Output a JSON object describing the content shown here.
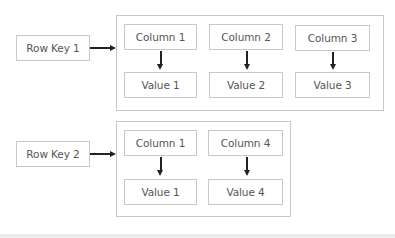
{
  "diagram": {
    "type": "wide-column-store-row-layout",
    "rows": [
      {
        "row_key": "Row Key 1",
        "cells": [
          {
            "column": "Column 1",
            "value": "Value 1"
          },
          {
            "column": "Column 2",
            "value": "Value 2"
          },
          {
            "column": "Column 3",
            "value": "Value 3"
          }
        ]
      },
      {
        "row_key": "Row Key 2",
        "cells": [
          {
            "column": "Column 1",
            "value": "Value 1"
          },
          {
            "column": "Column 4",
            "value": "Value 4"
          }
        ]
      }
    ]
  },
  "colors": {
    "border": "#c8c8c8",
    "arrow": "#222222",
    "text": "#555555",
    "footer": "#ececec"
  }
}
